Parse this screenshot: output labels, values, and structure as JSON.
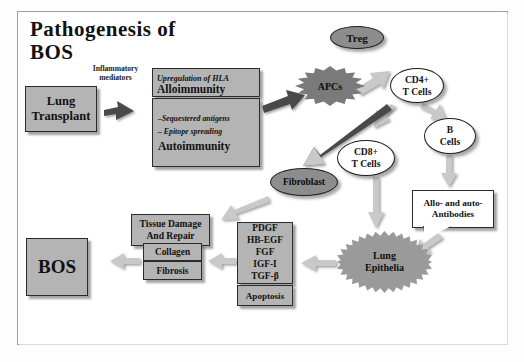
{
  "diagram": {
    "title": "Pathogenesis of\nBOS",
    "title_line1": "Pathogenesis of",
    "title_line2": "BOS",
    "frame_border_color": "#9aa0a8",
    "background": "#ffffff"
  },
  "labels": {
    "inflammatory_mediators": "Inflammatory\nmediators",
    "inflammatory_line1": "Inflammatory",
    "inflammatory_line2": "mediators"
  },
  "nodes": {
    "lung_transplant": {
      "label": "Lung\nTransplant",
      "line1": "Lung",
      "line2": "Transplant",
      "shape": "box",
      "fill": "#b4b4b4"
    },
    "alloimmunity": {
      "italic": "Upregulation of HLA",
      "bold": "Alloimmunity",
      "shape": "box",
      "fill": "#b4b4b4"
    },
    "autoimmunity": {
      "italic1": "–Sequestered antigens",
      "italic2": "– Epitope spreading",
      "bold": "Autoimmunity",
      "shape": "box",
      "fill": "#b4b4b4"
    },
    "apcs": {
      "label": "APCs",
      "shape": "starburst",
      "fill": "#7a7a7a"
    },
    "treg": {
      "label": "Treg",
      "shape": "ellipse",
      "fill": "#8d8d8d"
    },
    "cd4_t_cells": {
      "label": "CD4+\nT Cells",
      "line1": "CD4+",
      "line2": "T Cells",
      "shape": "ellipse",
      "fill": "#ffffff"
    },
    "cd8_t_cells": {
      "label": "CD8+\nT Cells",
      "line1": "CD8+",
      "line2": "T Cells",
      "shape": "ellipse",
      "fill": "#ffffff"
    },
    "b_cells": {
      "label": "B\nCells",
      "line1": "B",
      "line2": "Cells",
      "shape": "ellipse",
      "fill": "#ffffff"
    },
    "fibroblast": {
      "label": "Fibroblast",
      "shape": "ellipse",
      "fill": "#8d8d8d"
    },
    "antibodies": {
      "label": "Allo- and auto-\nAntibodies",
      "line1": "Allo- and auto-",
      "line2": "Antibodies",
      "shape": "callout",
      "fill": "#ffffff"
    },
    "lung_epithelia": {
      "label": "Lung\nEpithelia",
      "line1": "Lung",
      "line2": "Epithelia",
      "shape": "starburst",
      "fill": "#9a9a9a"
    },
    "growth_factors": {
      "items": [
        "PDGF",
        "HB-EGF",
        "FGF",
        "IGF-I",
        "TGF-β"
      ],
      "shape": "box",
      "fill": "#b4b4b4"
    },
    "apoptosis": {
      "label": "Apoptosis",
      "shape": "box",
      "fill": "#b4b4b4"
    },
    "tissue_damage": {
      "label": "Tissue Damage\nAnd Repair",
      "line1": "Tissue Damage",
      "line2": "And Repair",
      "shape": "box",
      "fill": "#b4b4b4"
    },
    "collagen": {
      "label": "Collagen",
      "shape": "box",
      "fill": "#b4b4b4"
    },
    "fibrosis": {
      "label": "Fibrosis",
      "shape": "box",
      "fill": "#b4b4b4"
    },
    "bos": {
      "label": "BOS",
      "shape": "box",
      "fill": "#b4b4b4"
    }
  },
  "edges": [
    {
      "from": "lung_transplant",
      "to": "alloimmunity",
      "style": "block-arrow-dark"
    },
    {
      "from": "autoimmunity",
      "to": "apcs",
      "style": "block-arrow-dark"
    },
    {
      "from": "apcs",
      "to": "cd4_t_cells",
      "style": "block-arrow-light"
    },
    {
      "from": "cd4_t_cells",
      "to": "b_cells",
      "style": "block-arrow-light"
    },
    {
      "from": "cd4_t_cells",
      "to": "cd8_t_cells",
      "style": "block-arrow-light"
    },
    {
      "from": "cd4_t_cells",
      "to": "fibroblast",
      "style": "block-arrow-dark"
    },
    {
      "from": "b_cells",
      "to": "antibodies",
      "style": "block-arrow-light"
    },
    {
      "from": "antibodies",
      "to": "lung_epithelia",
      "style": "block-arrow-light"
    },
    {
      "from": "cd8_t_cells",
      "to": "lung_epithelia",
      "style": "block-arrow-light"
    },
    {
      "from": "lung_epithelia",
      "to": "growth_factors",
      "style": "block-arrow-light"
    },
    {
      "from": "growth_factors",
      "to": "collagen",
      "style": "block-arrow-light"
    },
    {
      "from": "fibroblast",
      "to": "tissue_damage",
      "style": "block-arrow-light"
    },
    {
      "from": "collagen",
      "to": "bos",
      "style": "block-arrow-light"
    }
  ]
}
